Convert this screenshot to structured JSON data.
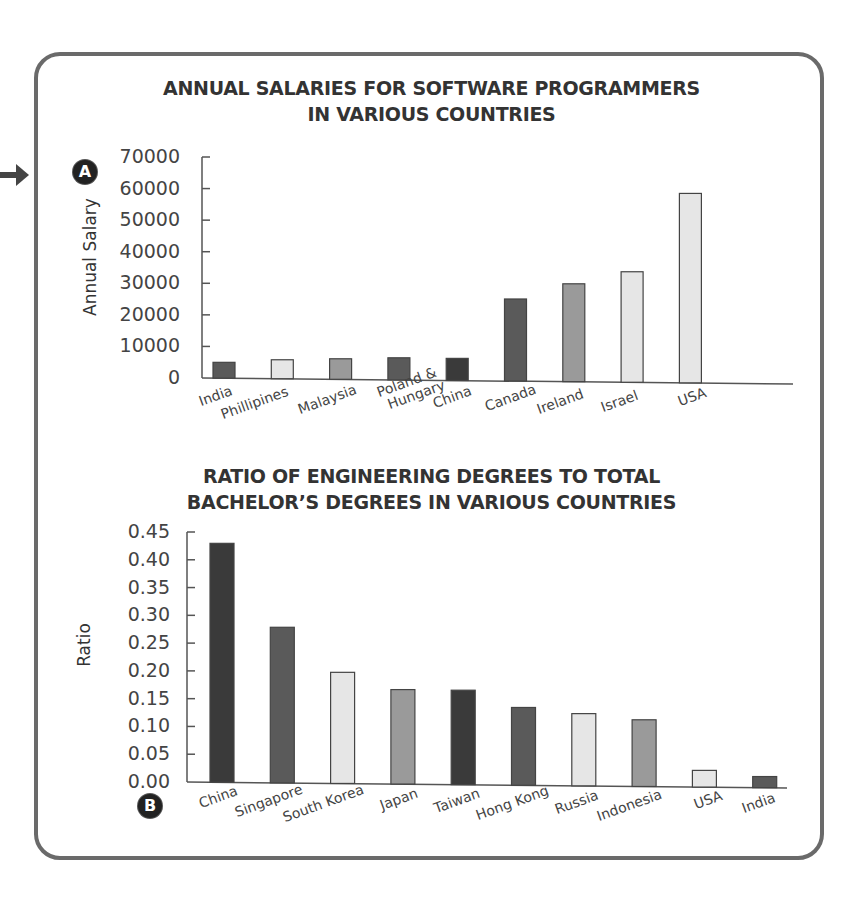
{
  "colors": {
    "frame": "#6a6a6a",
    "dark": "#3a3a3a",
    "medium_dark": "#5a5a5a",
    "medium": "#9a9a9a",
    "light": "#e6e6e6",
    "axis": "#555555",
    "text": "#333333"
  },
  "arrow_icon": "right-arrow",
  "chart_data": [
    {
      "type": "bar",
      "badge": "A",
      "title_line1": "ANNUAL SALARIES FOR SOFTWARE PROGRAMMERS",
      "title_line2": "IN VARIOUS COUNTRIES",
      "xlabel": "",
      "ylabel": "Annual Salary",
      "ylim": [
        0,
        70000
      ],
      "yticks": [
        "70000",
        "60000",
        "50000",
        "40000",
        "30000",
        "20000",
        "10000",
        "0"
      ],
      "grid": false,
      "categories": [
        "India",
        "Phillipines",
        "Malaysia",
        "Poland & Hungary",
        "China",
        "Canada",
        "Ireland",
        "Israel",
        "USA"
      ],
      "category_labels": [
        [
          "India"
        ],
        [
          "Phillipines"
        ],
        [
          "Malaysia"
        ],
        [
          "Poland &",
          "Hungary"
        ],
        [
          "China"
        ],
        [
          "Canada"
        ],
        [
          "Ireland"
        ],
        [
          "Israel"
        ],
        [
          "USA"
        ]
      ],
      "values": [
        5000,
        6000,
        6500,
        7000,
        7000,
        26000,
        31000,
        35000,
        60000
      ],
      "bar_shades": [
        "medium_dark",
        "light",
        "medium",
        "medium_dark",
        "dark",
        "medium_dark",
        "medium",
        "light",
        "light"
      ]
    },
    {
      "type": "bar",
      "badge": "B",
      "title_line1": "RATIO OF ENGINEERING DEGREES TO TOTAL",
      "title_line2": "BACHELOR’S DEGREES IN VARIOUS COUNTRIES",
      "xlabel": "",
      "ylabel": "Ratio",
      "ylim": [
        0,
        0.45
      ],
      "yticks": [
        "0.45",
        "0.40",
        "0.35",
        "0.30",
        "0.25",
        "0.20",
        "0.15",
        "0.10",
        "0.05",
        "0.00"
      ],
      "grid": false,
      "categories": [
        "China",
        "Singapore",
        "South Korea",
        "Japan",
        "Taiwan",
        "Hong Kong",
        "Russia",
        "Indonesia",
        "USA",
        "India"
      ],
      "category_labels": [
        [
          "China"
        ],
        [
          "Singapore"
        ],
        [
          "South Korea"
        ],
        [
          "Japan"
        ],
        [
          "Taiwan"
        ],
        [
          "Hong Kong"
        ],
        [
          "Russia"
        ],
        [
          "Indonesia"
        ],
        [
          "USA"
        ],
        [
          "India"
        ]
      ],
      "values": [
        0.43,
        0.28,
        0.2,
        0.17,
        0.17,
        0.14,
        0.13,
        0.12,
        0.03,
        0.02
      ],
      "bar_shades": [
        "dark",
        "medium_dark",
        "light",
        "medium",
        "dark",
        "medium_dark",
        "light",
        "medium",
        "light",
        "medium_dark"
      ]
    }
  ]
}
